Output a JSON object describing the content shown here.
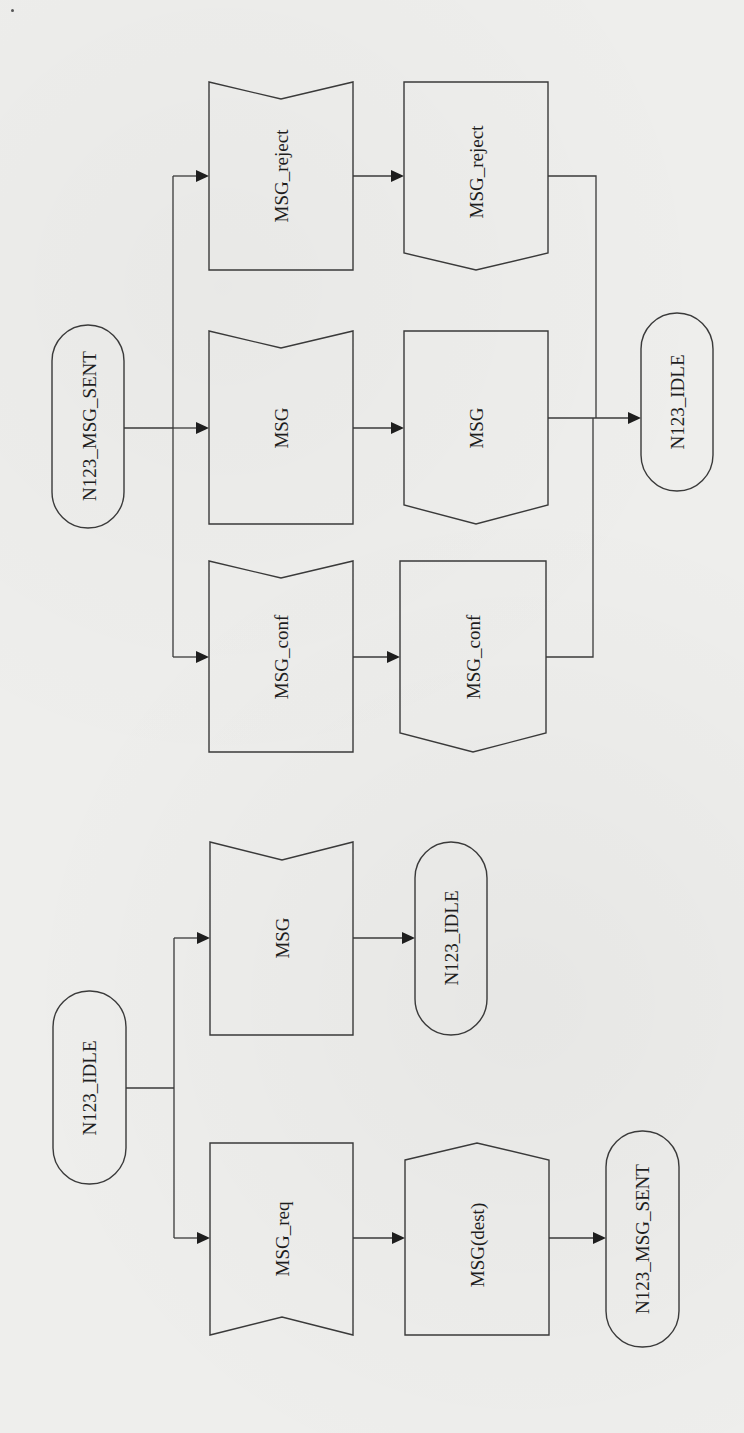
{
  "diagram": {
    "type": "SDL state transition diagram (rotated 90°)",
    "orientation": "rotated-90-ccw",
    "sections": [
      {
        "name": "from_msg_sent",
        "start_state": {
          "label": "N123_MSG_SENT"
        },
        "transitions": [
          {
            "input": "MSG_reject",
            "output": "MSG_reject",
            "next_state": "N123_IDLE"
          },
          {
            "input": "MSG",
            "output": "MSG",
            "next_state": "N123_IDLE"
          },
          {
            "input": "MSG_conf",
            "output": "MSG_conf",
            "next_state": "N123_IDLE"
          }
        ],
        "end_state": {
          "label": "N123_IDLE"
        }
      },
      {
        "name": "from_idle",
        "start_state": {
          "label": "N123_IDLE"
        },
        "transitions": [
          {
            "input": "MSG",
            "output": null,
            "next_state": "N123_IDLE"
          },
          {
            "input": "MSG_req",
            "output": "MSG(dest)",
            "next_state": "N123_MSG_SENT"
          }
        ]
      }
    ]
  },
  "labels": {
    "top_state": "N123_MSG_SENT",
    "in_reject": "MSG_reject",
    "out_reject": "MSG_reject",
    "in_msg": "MSG",
    "out_msg": "MSG",
    "in_conf": "MSG_conf",
    "out_conf": "MSG_conf",
    "top_end_state": "N123_IDLE",
    "bottom_state": "N123_IDLE",
    "in_msg_idle": "MSG",
    "idle_end_state": "N123_IDLE",
    "in_req": "MSG_req",
    "out_dest": "MSG(dest)",
    "bottom_end_state": "N123_MSG_SENT"
  },
  "colors": {
    "background": "#eeeeec",
    "stroke": "#3a3a3a",
    "text": "#1e1e1e"
  }
}
